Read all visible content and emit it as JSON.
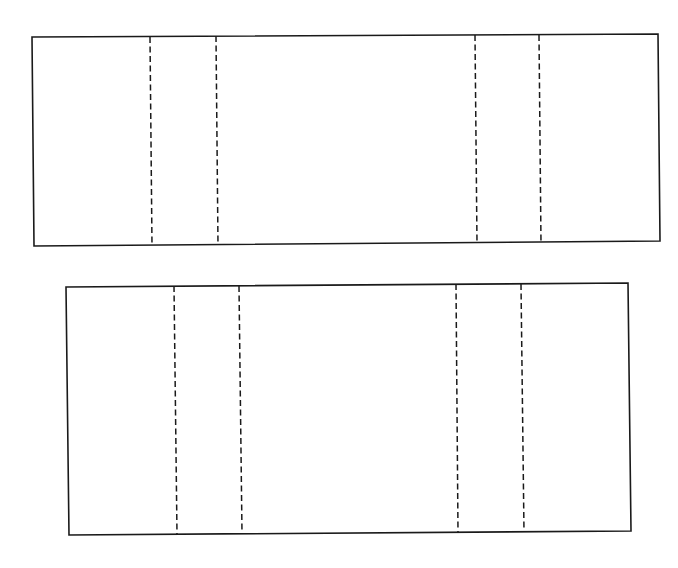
{
  "diagram": {
    "type": "fold-template",
    "colors": {
      "background": "#ffffff",
      "stroke": "#1a1a1a"
    },
    "panels": [
      {
        "id": "top-panel",
        "outline": [
          [
            32,
            37
          ],
          [
            658,
            34
          ],
          [
            660,
            241
          ],
          [
            34,
            246
          ]
        ],
        "fold_lines": [
          {
            "x1": 150,
            "y1": 37,
            "x2": 152,
            "y2": 245
          },
          {
            "x1": 216,
            "y1": 36,
            "x2": 218,
            "y2": 245
          },
          {
            "x1": 475,
            "y1": 35,
            "x2": 477,
            "y2": 243
          },
          {
            "x1": 539,
            "y1": 35,
            "x2": 541,
            "y2": 243
          }
        ]
      },
      {
        "id": "bottom-panel",
        "outline": [
          [
            66,
            287
          ],
          [
            628,
            283
          ],
          [
            631,
            531
          ],
          [
            69,
            535
          ]
        ],
        "fold_lines": [
          {
            "x1": 174,
            "y1": 286,
            "x2": 177,
            "y2": 534
          },
          {
            "x1": 239,
            "y1": 286,
            "x2": 242,
            "y2": 533
          },
          {
            "x1": 456,
            "y1": 284,
            "x2": 458,
            "y2": 532
          },
          {
            "x1": 521,
            "y1": 284,
            "x2": 524,
            "y2": 532
          }
        ]
      }
    ]
  }
}
